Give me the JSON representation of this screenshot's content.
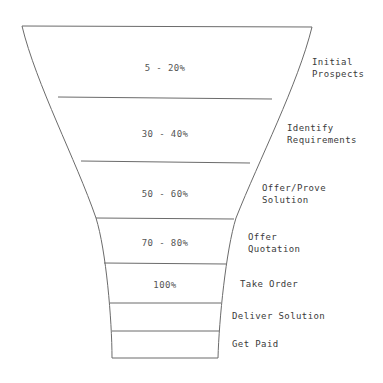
{
  "diagram": {
    "type": "funnel",
    "orientation": "vertical",
    "stroke_color": "#6b6b6b",
    "fill_color": "#ffffff",
    "text_color": "#3a3a3a",
    "stages": [
      {
        "id": "initial-prospects",
        "percent": "5 - 20%",
        "label_line1": "Initial",
        "label_line2": "Prospects",
        "percent_x": 165,
        "percent_y": 68,
        "label_x": 312,
        "label_y": 68
      },
      {
        "id": "identify-requirements",
        "percent": "30 - 40%",
        "label_line1": "Identify",
        "label_line2": "Requirements",
        "percent_x": 165,
        "percent_y": 134,
        "label_x": 287,
        "label_y": 134
      },
      {
        "id": "offer-prove-solution",
        "percent": "50 - 60%",
        "label_line1": "Offer/Prove",
        "label_line2": "Solution",
        "percent_x": 165,
        "percent_y": 194,
        "label_x": 262,
        "label_y": 194
      },
      {
        "id": "offer-quotation",
        "percent": "70 - 80%",
        "label_line1": "Offer",
        "label_line2": "Quotation",
        "percent_x": 165,
        "percent_y": 243,
        "label_x": 248,
        "label_y": 243
      },
      {
        "id": "take-order",
        "percent": "100%",
        "label_line1": "Take Order",
        "label_line2": "",
        "percent_x": 165,
        "percent_y": 285,
        "label_x": 240,
        "label_y": 285
      },
      {
        "id": "deliver-solution",
        "percent": "",
        "label_line1": "Deliver Solution",
        "label_line2": "",
        "percent_x": 165,
        "percent_y": 317,
        "label_x": 232,
        "label_y": 317
      },
      {
        "id": "get-paid",
        "percent": "",
        "label_line1": "Get Paid",
        "label_line2": "",
        "percent_x": 165,
        "percent_y": 345,
        "label_x": 232,
        "label_y": 345
      }
    ],
    "geometry": {
      "left_outline_path": "M 22 26 C 36 84, 76 160, 96 218 C 106 250, 112 320, 112 358",
      "right_outline_path": "M 312 27 C 298 84, 259 160, 236 218 C 226 250, 219 320, 218 358",
      "top_edge": {
        "x1": 22,
        "y1": 26,
        "x2": 312,
        "y2": 27
      },
      "bottom_edge": {
        "x1": 112,
        "y1": 358,
        "x2": 218,
        "y2": 358
      },
      "dividers": [
        {
          "x1": 58,
          "y1": 97,
          "x2": 272,
          "y2": 99
        },
        {
          "x1": 81,
          "y1": 161,
          "x2": 250,
          "y2": 163
        },
        {
          "x1": 96,
          "y1": 218,
          "x2": 234,
          "y2": 219
        },
        {
          "x1": 104,
          "y1": 263,
          "x2": 226,
          "y2": 264
        },
        {
          "x1": 110,
          "y1": 303,
          "x2": 221,
          "y2": 303
        },
        {
          "x1": 112,
          "y1": 331,
          "x2": 219,
          "y2": 331
        }
      ]
    }
  }
}
